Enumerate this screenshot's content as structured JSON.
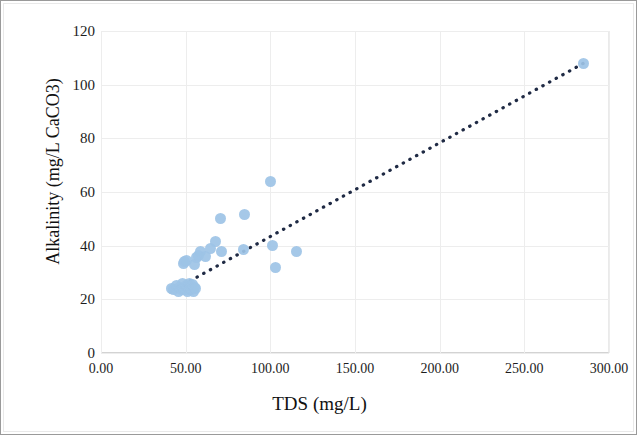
{
  "chart_data": {
    "type": "scatter",
    "title": "",
    "xlabel": "TDS (mg/L)",
    "ylabel": "Alkalinity (mg/L CaCO3)",
    "xlim": [
      0,
      300
    ],
    "ylim": [
      0,
      120
    ],
    "xticks": [
      "0.00",
      "50.00",
      "100.00",
      "150.00",
      "200.00",
      "250.00",
      "300.00"
    ],
    "xtick_values": [
      0,
      50,
      100,
      150,
      200,
      250,
      300
    ],
    "yticks": [
      "0",
      "20",
      "40",
      "60",
      "80",
      "100",
      "120"
    ],
    "ytick_values": [
      0,
      20,
      40,
      60,
      80,
      100,
      120
    ],
    "grid": true,
    "legend": "none",
    "marker_color": "#9DC3E6",
    "trendline_color": "#1F2A44",
    "trendline_style": "dotted",
    "series": [
      {
        "name": "Alkalinity vs TDS",
        "points": [
          [
            41.5,
            24.0
          ],
          [
            43.0,
            23.5
          ],
          [
            44.5,
            25.0
          ],
          [
            45.5,
            23.0
          ],
          [
            46.5,
            24.5
          ],
          [
            47.5,
            23.5
          ],
          [
            48.0,
            26.0
          ],
          [
            48.5,
            24.0
          ],
          [
            49.0,
            33.5
          ],
          [
            49.5,
            34.0
          ],
          [
            50.0,
            23.5
          ],
          [
            50.5,
            25.0
          ],
          [
            50.5,
            34.5
          ],
          [
            51.0,
            23.0
          ],
          [
            51.5,
            24.5
          ],
          [
            52.0,
            23.5
          ],
          [
            52.5,
            26.0
          ],
          [
            53.0,
            24.0
          ],
          [
            53.5,
            23.5
          ],
          [
            54.0,
            25.5
          ],
          [
            54.5,
            23.0
          ],
          [
            55.0,
            24.5
          ],
          [
            55.5,
            33.0
          ],
          [
            56.0,
            24.0
          ],
          [
            56.5,
            35.5
          ],
          [
            57.5,
            36.5
          ],
          [
            59.0,
            38.0
          ],
          [
            62.0,
            36.0
          ],
          [
            64.5,
            39.0
          ],
          [
            67.5,
            41.5
          ],
          [
            70.5,
            50.0
          ],
          [
            71.0,
            38.0
          ],
          [
            84.0,
            38.5
          ],
          [
            85.0,
            51.5
          ],
          [
            100.0,
            64.0
          ],
          [
            101.5,
            40.0
          ],
          [
            103.0,
            32.0
          ],
          [
            115.5,
            38.0
          ],
          [
            285.0,
            108.0
          ]
        ]
      }
    ],
    "trendline": {
      "x0": 41.0,
      "y0": 22.8,
      "x1": 285.0,
      "y1": 108.0
    }
  }
}
